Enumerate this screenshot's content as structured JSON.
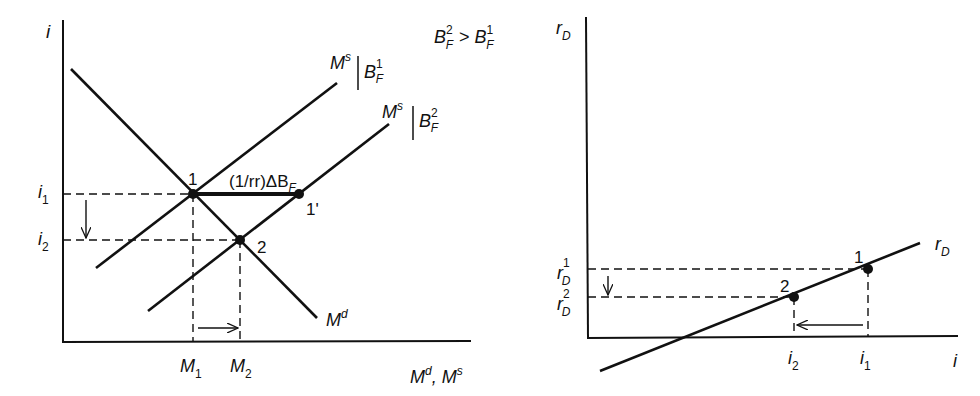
{
  "left_panel": {
    "y_axis_label": "i",
    "x_axis_label": "M",
    "x_axis_label_sup1": "d",
    "x_axis_label_mid": ", M",
    "x_axis_label_sup2": "s",
    "condition": {
      "lhs": "B",
      "lhs_sup": "2",
      "lhs_sub": "F",
      "op": ">",
      "rhs": "B",
      "rhs_sup": "1",
      "rhs_sub": "F"
    },
    "curves": {
      "money_demand": {
        "label": "M",
        "sup": "d"
      },
      "money_supply_1": {
        "label": "M",
        "sup": "s",
        "cond": "B",
        "cond_sup": "1",
        "cond_sub": "F"
      },
      "money_supply_2": {
        "label": "M",
        "sup": "s",
        "cond": "B",
        "cond_sup": "2",
        "cond_sub": "F"
      }
    },
    "points": {
      "p1": "1",
      "p1prime": "1'",
      "p2": "2"
    },
    "shift_label": "(1/rr)ΔB",
    "shift_label_sub": "F",
    "y_ticks": [
      {
        "label": "i",
        "sub": "1"
      },
      {
        "label": "i",
        "sub": "2"
      }
    ],
    "x_ticks": [
      {
        "label": "M",
        "sub": "1"
      },
      {
        "label": "M",
        "sub": "2"
      }
    ]
  },
  "right_panel": {
    "y_axis_label": "r",
    "y_axis_label_sub": "D",
    "x_axis_label": "i",
    "curve_label": "r",
    "curve_label_sub": "D",
    "points": {
      "p1": "1",
      "p2": "2"
    },
    "y_ticks": [
      {
        "label": "r",
        "sub": "D",
        "sup": "1"
      },
      {
        "label": "r",
        "sub": "D",
        "sup": "2"
      }
    ],
    "x_ticks": [
      {
        "label": "i",
        "sub": "2"
      },
      {
        "label": "i",
        "sub": "1"
      }
    ]
  },
  "colors": {
    "ink": "#111111",
    "background": "#ffffff"
  }
}
